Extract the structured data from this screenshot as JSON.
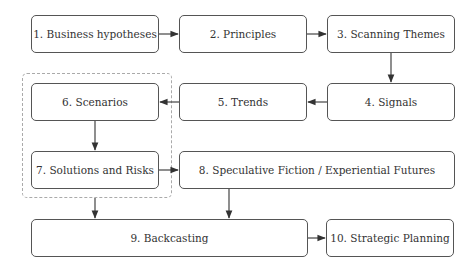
{
  "diagram": {
    "nodes": [
      {
        "id": 1,
        "label": "1. Business hypotheses"
      },
      {
        "id": 2,
        "label": "2. Principles"
      },
      {
        "id": 3,
        "label": "3. Scanning Themes"
      },
      {
        "id": 4,
        "label": "4. Signals"
      },
      {
        "id": 5,
        "label": "5. Trends"
      },
      {
        "id": 6,
        "label": "6. Scenarios"
      },
      {
        "id": 7,
        "label": "7. Solutions and Risks"
      },
      {
        "id": 8,
        "label": "8. Speculative Fiction / Experiential Futures"
      },
      {
        "id": 9,
        "label": "9. Backcasting"
      },
      {
        "id": 10,
        "label": "10. Strategic Planning"
      }
    ],
    "edges": [
      {
        "from": 1,
        "to": 2
      },
      {
        "from": 2,
        "to": 3
      },
      {
        "from": 3,
        "to": 4
      },
      {
        "from": 4,
        "to": 5
      },
      {
        "from": 5,
        "to": 6
      },
      {
        "from": 6,
        "to": 7
      },
      {
        "from": 7,
        "to": 8
      },
      {
        "from": 7,
        "to": 9
      },
      {
        "from": 8,
        "to": 9
      },
      {
        "from": 9,
        "to": 10
      }
    ],
    "groups": [
      {
        "members": [
          6,
          7
        ],
        "style": "dashed"
      }
    ],
    "colors": {
      "stroke": "#555555",
      "text": "#333333",
      "group_border": "#aaaaaa"
    }
  }
}
